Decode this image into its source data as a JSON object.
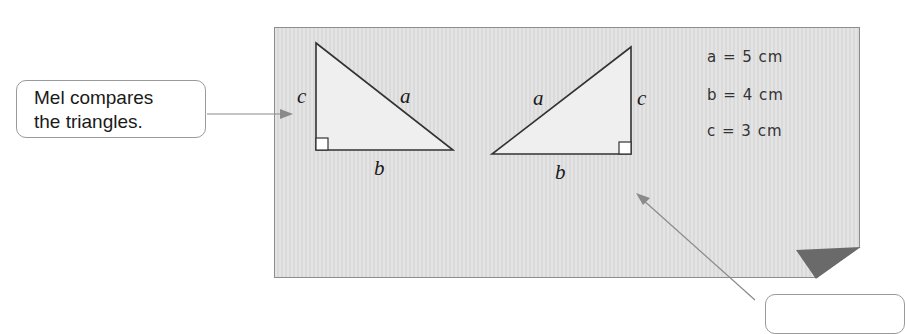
{
  "callout_left": {
    "line1": "Mel compares",
    "line2": "the triangles."
  },
  "triangle_left": {
    "labels": {
      "a": "a",
      "b": "b",
      "c": "c"
    }
  },
  "triangle_right": {
    "labels": {
      "a": "a",
      "b": "b",
      "c": "c"
    }
  },
  "measurements": [
    {
      "text": "a = 5 cm"
    },
    {
      "text": "b = 4 cm"
    },
    {
      "text": "c = 3 cm"
    }
  ],
  "colors": {
    "paper": "#dedede",
    "triangle_fill": "#eeeeee",
    "fold": "#6a6a6a",
    "arrow": "#8a8a8a"
  }
}
